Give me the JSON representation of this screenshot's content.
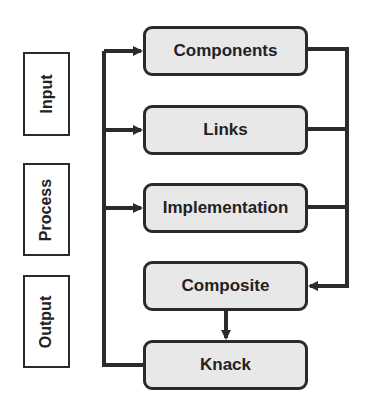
{
  "diagram": {
    "stages": [
      {
        "id": "input",
        "label": "Input"
      },
      {
        "id": "process",
        "label": "Process"
      },
      {
        "id": "output",
        "label": "Output"
      }
    ],
    "nodes": [
      {
        "id": "components",
        "label": "Components"
      },
      {
        "id": "links",
        "label": "Links"
      },
      {
        "id": "implementation",
        "label": "Implementation"
      },
      {
        "id": "composite",
        "label": "Composite"
      },
      {
        "id": "knack",
        "label": "Knack"
      }
    ],
    "edges": [
      {
        "from": "knack",
        "to": "components"
      },
      {
        "from": "knack",
        "to": "links"
      },
      {
        "from": "knack",
        "to": "implementation"
      },
      {
        "from": "components",
        "to": "composite"
      },
      {
        "from": "links",
        "to": "composite"
      },
      {
        "from": "implementation",
        "to": "composite"
      },
      {
        "from": "composite",
        "to": "knack"
      }
    ],
    "colors": {
      "node_fill": "#e8e8e8",
      "stroke": "#2b2b2b",
      "background": "#ffffff"
    }
  }
}
